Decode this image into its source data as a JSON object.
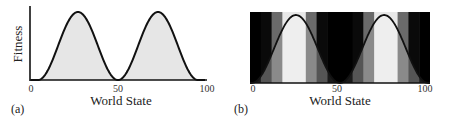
{
  "chart_data": [
    {
      "type": "area",
      "panel_label": "(a)",
      "title": "",
      "xlabel": "World State",
      "ylabel": "Fitness",
      "xlim": [
        0,
        100
      ],
      "xticks": [
        "0",
        "50",
        "100"
      ],
      "fill_color": "#e6e6e6",
      "line_color": "#111111",
      "description": "Bimodal fitness landscape: two smooth peaks near world state 25 and 75, dipping to zero at 0-5, 50 and 95-100.",
      "x": [
        0,
        5,
        10,
        15,
        20,
        25,
        30,
        35,
        40,
        45,
        50,
        55,
        60,
        65,
        70,
        75,
        80,
        85,
        90,
        95,
        100
      ],
      "values": [
        0,
        0,
        0.2,
        0.55,
        0.85,
        1.0,
        0.92,
        0.65,
        0.33,
        0.08,
        0,
        0.08,
        0.33,
        0.65,
        0.92,
        1.0,
        0.85,
        0.55,
        0.2,
        0,
        0
      ],
      "ylim": [
        0,
        1
      ]
    },
    {
      "type": "heatmap",
      "panel_label": "(b)",
      "title": "",
      "xlabel": "World State",
      "ylabel": "",
      "xlim": [
        0,
        100
      ],
      "xticks": [
        "0",
        "50",
        "100"
      ],
      "line_color": "#111111",
      "description": "Same bimodal curve overlaid on vertical grey-level bands (discretized perception of world state); regions below the curve are lighter, above the curve darker.",
      "bands": [
        {
          "x0": 0,
          "x1": 6,
          "above": "#000000",
          "below": "#1a1a1a"
        },
        {
          "x0": 6,
          "x1": 12,
          "above": "#0a0a0a",
          "below": "#555555"
        },
        {
          "x0": 12,
          "x1": 18,
          "above": "#6a6a6a",
          "below": "#8a8a8a"
        },
        {
          "x0": 18,
          "x1": 31,
          "above": "#e8e8e8",
          "below": "#eeeeee"
        },
        {
          "x0": 31,
          "x1": 37,
          "above": "#6a6a6a",
          "below": "#8a8a8a"
        },
        {
          "x0": 37,
          "x1": 43,
          "above": "#0a0a0a",
          "below": "#555555"
        },
        {
          "x0": 43,
          "x1": 57,
          "above": "#000000",
          "below": "#1a1a1a"
        },
        {
          "x0": 57,
          "x1": 63,
          "above": "#0a0a0a",
          "below": "#555555"
        },
        {
          "x0": 63,
          "x1": 69,
          "above": "#6a6a6a",
          "below": "#8a8a8a"
        },
        {
          "x0": 69,
          "x1": 82,
          "above": "#e8e8e8",
          "below": "#eeeeee"
        },
        {
          "x0": 82,
          "x1": 88,
          "above": "#6a6a6a",
          "below": "#8a8a8a"
        },
        {
          "x0": 88,
          "x1": 94,
          "above": "#0a0a0a",
          "below": "#555555"
        },
        {
          "x0": 94,
          "x1": 100,
          "above": "#000000",
          "below": "#1a1a1a"
        }
      ],
      "x": [
        0,
        5,
        10,
        15,
        20,
        25,
        30,
        35,
        40,
        45,
        50,
        55,
        60,
        65,
        70,
        75,
        80,
        85,
        90,
        95,
        100
      ],
      "values": [
        0,
        0.12,
        0.35,
        0.62,
        0.86,
        0.97,
        0.9,
        0.66,
        0.38,
        0.12,
        0,
        0.12,
        0.38,
        0.66,
        0.9,
        0.97,
        0.86,
        0.62,
        0.35,
        0.12,
        0
      ],
      "ylim": [
        0,
        1
      ]
    }
  ],
  "panel_a": {
    "label": "(a)",
    "ylabel": "Fitness",
    "xlabel": "World State",
    "ticks": [
      "0",
      "50",
      "100"
    ]
  },
  "panel_b": {
    "label": "(b)",
    "xlabel": "World State",
    "ticks": [
      "0",
      "50",
      "100"
    ]
  }
}
